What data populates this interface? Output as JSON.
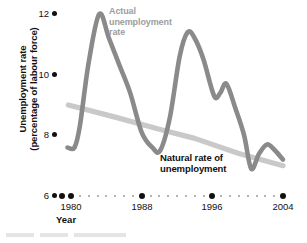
{
  "chart": {
    "ylabel_line1": "Unemployment rate",
    "ylabel_line2": "(percentage of labour force)",
    "xlabel": "Year",
    "label_actual_line1": "Actual",
    "label_actual_line2": "unemployment",
    "label_actual_line3": "rate",
    "label_natural_line1": "Natural rate of",
    "label_natural_line2": "unemployment",
    "ytick_12": "12",
    "ytick_10": "10",
    "ytick_8": "8",
    "ytick_6": "6",
    "xtick_1980": "1980",
    "xtick_1988": "1988",
    "xtick_1996": "1996",
    "xtick_2004": "2004",
    "color_actual": "#8a8a8a",
    "color_natural": "#c9c9c9",
    "color_text": "#111111",
    "color_label_actual": "#9d9d9d"
  },
  "chart_data": {
    "type": "line",
    "title": "",
    "subtitle": "",
    "xlabel": "Year",
    "ylabel": "Unemployment rate (percentage of labour force)",
    "xlim": [
      1979,
      2004
    ],
    "ylim": [
      6,
      12
    ],
    "xticks": [
      1980,
      1988,
      1996,
      2004
    ],
    "yticks": [
      6,
      8,
      10,
      12
    ],
    "minor_xticks_every": 1,
    "grid": false,
    "legend": "inline-annotations",
    "annotations": [
      {
        "text": "Actual unemployment rate",
        "x": 1984.5,
        "y": 11.9,
        "color": "#9d9d9d"
      },
      {
        "text": "Natural rate of unemployment",
        "x": 1990.5,
        "y": 7.2,
        "color": "#111111"
      }
    ],
    "series": [
      {
        "name": "Actual unemployment rate",
        "color": "#8a8a8a",
        "x": [
          1979.6,
          1980.4,
          1981.0,
          1982.0,
          1983.2,
          1984.3,
          1985.5,
          1986.7,
          1988.0,
          1989.2,
          1990.1,
          1991.2,
          1992.3,
          1993.2,
          1994.0,
          1995.0,
          1996.2,
          1996.9,
          1997.6,
          1998.6,
          1999.6,
          2000.4,
          2001.3,
          2002.2,
          2003.1,
          2004.0
        ],
        "y": [
          7.6,
          7.6,
          8.3,
          10.4,
          12.0,
          11.2,
          10.3,
          9.4,
          8.1,
          7.6,
          7.5,
          8.6,
          10.6,
          11.4,
          11.2,
          10.5,
          9.3,
          9.4,
          9.7,
          8.9,
          8.0,
          6.9,
          7.4,
          7.7,
          7.5,
          7.2
        ]
      },
      {
        "name": "Natural rate of unemployment",
        "color": "#c9c9c9",
        "x": [
          1979.7,
          1985.0,
          1990.0,
          1994.0,
          1999.0,
          2004.0
        ],
        "y": [
          9.0,
          8.6,
          8.2,
          7.9,
          7.4,
          7.0
        ]
      }
    ]
  }
}
